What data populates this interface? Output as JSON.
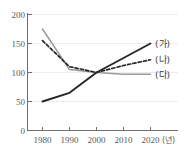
{
  "chart_data": {
    "type": "line",
    "title": "",
    "subtitle": "",
    "xlabel": "(년)",
    "ylabel": "",
    "x": [
      1980,
      1990,
      2000,
      2010,
      2020
    ],
    "xtick_labels": [
      "1980",
      "1990",
      "2000",
      "2010",
      "2020"
    ],
    "ytick_labels": [
      "0",
      "50",
      "100",
      "150",
      "200"
    ],
    "yticks": [
      0,
      50,
      100,
      150,
      200
    ],
    "xlim": [
      1975,
      2025
    ],
    "ylim": [
      0,
      200
    ],
    "grid": true,
    "grid_axis": "y",
    "legend_position": "right-of-lines",
    "series": [
      {
        "name": "(가)",
        "label": "(가)",
        "style": "solid",
        "color": "#262626",
        "width": 1.9,
        "values": [
          50,
          65,
          100,
          125,
          150
        ]
      },
      {
        "name": "(나)",
        "label": "(나)",
        "style": "dashed",
        "color": "#262626",
        "width": 1.7,
        "values": [
          155,
          110,
          100,
          112,
          122
        ]
      },
      {
        "name": "(다)",
        "label": "(다)",
        "style": "solid",
        "color": "#9a9a9a",
        "width": 1.5,
        "values": [
          175,
          105,
          100,
          97,
          97
        ]
      }
    ]
  },
  "axes": {
    "y_ticks": [
      {
        "label": "200",
        "value": 200
      },
      {
        "label": "150",
        "value": 150
      },
      {
        "label": "100",
        "value": 100
      },
      {
        "label": "50",
        "value": 50
      },
      {
        "label": "0",
        "value": 0
      }
    ],
    "x_ticks": [
      {
        "label": "1980",
        "value": 1980
      },
      {
        "label": "1990",
        "value": 1990
      },
      {
        "label": "2000",
        "value": 2000
      },
      {
        "label": "2010",
        "value": 2010
      },
      {
        "label": "2020",
        "value": 2020
      }
    ],
    "x_unit": "(년)"
  },
  "legend": {
    "items": [
      {
        "label": "(가)"
      },
      {
        "label": "(나)"
      },
      {
        "label": "(다)"
      }
    ]
  },
  "colors": {
    "series_dark": "#262626",
    "series_gray": "#9a9a9a",
    "axis": "#6e6e6e",
    "grid": "#ececec",
    "text": "#595959",
    "background": "#ffffff"
  }
}
